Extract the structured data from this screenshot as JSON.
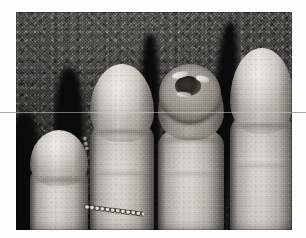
{
  "document": {
    "type": "clinical-photograph",
    "modality": "film photograph, grayscale halftone reproduction",
    "caption": "",
    "page_background": "#fdfdfd"
  },
  "photo": {
    "name": "fingertips-clinical-photo",
    "alt_text": "Grayscale close-up photograph of four fingertips of a hand resting against a dark textured cloth background; the third fingertip from the left bears a raised, dome-shaped nodule with a central crater and keratotic surface.",
    "frame": {
      "left": 16,
      "top": 12,
      "width": 276,
      "height": 218
    },
    "orientation": "landscape",
    "color_mode": "grayscale",
    "backdrop": {
      "name": "textured-cloth-backdrop",
      "description": "dark speckled woven fabric",
      "base_color": "#4a4a48",
      "light_speck_color": "#e6e4df",
      "dark_speck_color": "#121210"
    },
    "lighting": {
      "key_light_direction": "upper-left",
      "falloff": "bottom of frame darkens to near black"
    }
  },
  "subjects": [
    {
      "id": "finger-1",
      "name": "index-fingertip-leftmost",
      "position": "far left, lowest in frame",
      "tone": "#cfc9c1",
      "features": [
        "rounded nail plate",
        "distal crease",
        "partially cropped by frame edge"
      ],
      "lesion": false
    },
    {
      "id": "finger-2",
      "name": "second-fingertip",
      "position": "left of center, tallest",
      "tone": "#d2ccc4",
      "features": [
        "broad pale nail plate",
        "bright specular highlight",
        "distal interphalangeal crease"
      ],
      "lesion": false
    },
    {
      "id": "finger-3",
      "name": "third-fingertip-with-lesion",
      "position": "right of center",
      "tone": "#c3bdb5",
      "features": [
        "dome-shaped nodule replacing nail bed",
        "central crater",
        "keratotic rim"
      ],
      "lesion": true
    },
    {
      "id": "finger-4",
      "name": "fourth-fingertip-rightmost",
      "position": "far right, tallest",
      "tone": "#d4cec6",
      "features": [
        "elongated pale nail plate",
        "smooth contour",
        "distal crease"
      ],
      "lesion": false
    }
  ],
  "lesion": {
    "name": "periungual-nodule",
    "on_subject": "finger-3",
    "shape": "dome-shaped / hemispherical",
    "surface": "verrucous with central umbilicated crater",
    "rim_tone": "#8d877f",
    "crater_tone": "#2b2721",
    "keratin_tone": "#f2efe9",
    "approx_center_px": {
      "x": 186,
      "y": 96
    },
    "approx_diameter_px": 60
  },
  "accessory": {
    "name": "beaded-chain",
    "description": "small beaded chain or bracelet visible between the first and second fingers near the lower frame",
    "bead_highlight": "#e8e4dc",
    "bead_shadow": "#1b1916"
  },
  "artifacts": {
    "scan_line": {
      "name": "horizontal-scan-line",
      "description": "faint light horizontal line crossing the full image width",
      "y_px": 112,
      "color": "#aaaaaa"
    },
    "grain": "visible film grain / halftone dot structure throughout"
  }
}
